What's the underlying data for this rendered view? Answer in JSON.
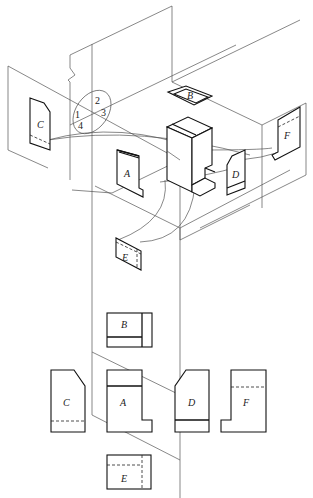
{
  "figure": {
    "type": "six-view orthographic projection diagram",
    "isometric": {
      "view_labels": {
        "front": "A",
        "top": "B",
        "left": "C",
        "right": "D",
        "bottom": "E",
        "rear": "F"
      },
      "quadrant_labels": [
        "1",
        "2",
        "3",
        "4"
      ]
    },
    "flat_views": {
      "top_row": [
        {
          "label": "B",
          "position": "above A"
        }
      ],
      "middle_row": [
        {
          "label": "C",
          "position": "left of A"
        },
        {
          "label": "A",
          "position": "center"
        },
        {
          "label": "D",
          "position": "right of A"
        },
        {
          "label": "F",
          "position": "far right"
        }
      ],
      "bottom_row": [
        {
          "label": "E",
          "position": "below A"
        }
      ]
    }
  },
  "colors": {
    "background": "#ffffff",
    "line": "#111111",
    "construction": "#555555"
  }
}
